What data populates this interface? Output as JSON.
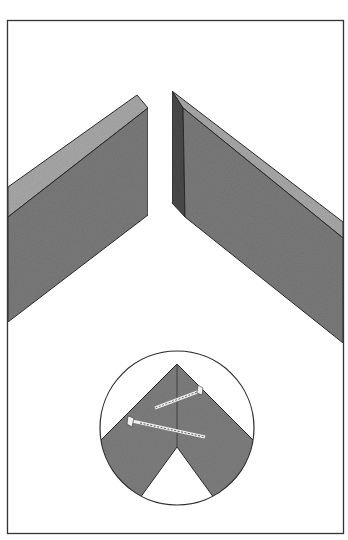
{
  "figure": {
    "colors": {
      "background": "#ffffff",
      "frame": "#333333",
      "board_front": "#7a7a7a",
      "board_top": "#a8a8a8",
      "board_end_dark": "#4a4a4a",
      "outline": "#2a2a2a",
      "screw": "#e8e8e8"
    },
    "parts": [
      {
        "name": "left-board",
        "label": ""
      },
      {
        "name": "right-board",
        "label": ""
      },
      {
        "name": "detail-inset",
        "label": ""
      }
    ],
    "inset": {
      "shape": "circle",
      "screws": 2
    }
  }
}
